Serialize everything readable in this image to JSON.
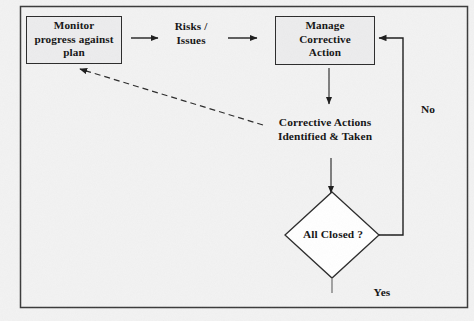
{
  "diagram": {
    "type": "flowchart",
    "background_color": "#f2f2f2",
    "line_color": "#2b2b2b",
    "frame": {
      "x": 20,
      "y": 6,
      "width": 448,
      "height": 302
    },
    "nodes": [
      {
        "id": "monitor",
        "shape": "process-box",
        "label": "Monitor\nprogress against\nplan",
        "lines": [
          "Monitor",
          "progress against",
          "plan"
        ],
        "x": 26,
        "y": 16,
        "width": 96,
        "height": 48,
        "fill": "#ececed",
        "stroke": "#2b2b2b"
      },
      {
        "id": "risks",
        "shape": "text",
        "label": "Risks /\nIssues",
        "lines": [
          "Risks /",
          "Issues"
        ],
        "x": 160,
        "y": 20,
        "width": 62
      },
      {
        "id": "manage",
        "shape": "process-box",
        "label": "Manage\nCorrective\nAction",
        "lines": [
          "Manage",
          "Corrective",
          "Action"
        ],
        "x": 275,
        "y": 16,
        "width": 100,
        "height": 49,
        "fill": "#ececed",
        "stroke": "#2b2b2b"
      },
      {
        "id": "corrective-actions",
        "shape": "text",
        "label": "Corrective Actions\nIdentified & Taken",
        "lines": [
          "Corrective Actions",
          "Identified & Taken"
        ],
        "x": 258,
        "y": 116,
        "width": 134
      },
      {
        "id": "all-closed",
        "shape": "diamond",
        "label": "All Closed ?",
        "lines": [
          "All Closed ?"
        ],
        "cx": 332,
        "cy": 235,
        "half_width": 47,
        "half_height": 43,
        "fill": "#ffffff",
        "stroke": "#2b2b2b"
      }
    ],
    "edge_labels": [
      {
        "id": "no",
        "text": "No",
        "x": 414,
        "y": 103
      },
      {
        "id": "yes",
        "text": "Yes",
        "x": 364,
        "y": 286
      }
    ],
    "edges": [
      {
        "id": "monitor-to-risks",
        "from": "monitor",
        "to": "risks",
        "style": "solid",
        "arrow": "end"
      },
      {
        "id": "risks-to-manage",
        "from": "risks",
        "to": "manage",
        "style": "solid",
        "arrow": "end"
      },
      {
        "id": "manage-to-corrective-actions",
        "from": "manage",
        "to": "corrective-actions",
        "style": "solid",
        "arrow": "end"
      },
      {
        "id": "corrective-actions-to-all-closed",
        "from": "corrective-actions",
        "to": "all-closed",
        "style": "solid",
        "arrow": "end"
      },
      {
        "id": "all-closed-no-to-manage",
        "from": "all-closed",
        "to": "manage",
        "style": "solid",
        "arrow": "end",
        "label": "No"
      },
      {
        "id": "all-closed-yes-out",
        "from": "all-closed",
        "to": "exit",
        "style": "solid",
        "arrow": "none",
        "label": "Yes"
      },
      {
        "id": "corrective-actions-to-monitor-feedback",
        "from": "corrective-actions",
        "to": "monitor",
        "style": "dashed",
        "arrow": "end"
      }
    ]
  }
}
